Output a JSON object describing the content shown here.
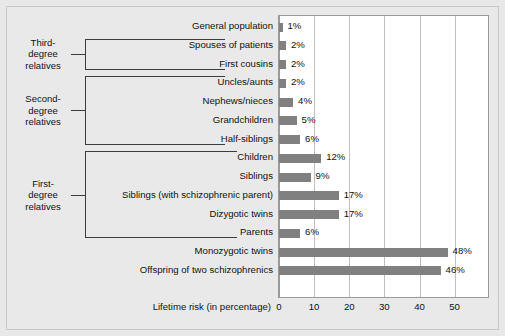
{
  "chart_data": {
    "type": "bar",
    "orientation": "horizontal",
    "title": "",
    "xlabel": "Lifetime risk (in percentage)",
    "ylabel": "",
    "xlim": [
      0,
      59.5
    ],
    "xticks": [
      0,
      10,
      20,
      30,
      40,
      50
    ],
    "xtick_labels": [
      "0",
      "10",
      "20",
      "30",
      "40",
      "50"
    ],
    "grid": "vertical",
    "legend": "none",
    "value_suffix": "%",
    "bar_color": "#808080",
    "plot_background": "#ffffff",
    "figure_background": "#e9e9e9",
    "categories": [
      "General population",
      "Spouses of patients",
      "First cousins",
      "Uncles/aunts",
      "Nephews/nieces",
      "Grandchildren",
      "Half-siblings",
      "Children",
      "Siblings",
      "Siblings (with schizophrenic parent)",
      "Dizygotic twins",
      "Parents",
      "Monozygotic twins",
      "Offspring of two schizophrenics"
    ],
    "values": [
      1,
      2,
      2,
      2,
      4,
      5,
      6,
      12,
      9,
      17,
      17,
      6,
      48,
      46
    ],
    "value_labels": [
      "1%",
      "2%",
      "2%",
      "2%",
      "4%",
      "5%",
      "6%",
      "12%",
      "9%",
      "17%",
      "17%",
      "6%",
      "48%",
      "46%"
    ],
    "groups": [
      {
        "label_lines": [
          "Third-",
          "degree",
          "relatives"
        ],
        "name": "third-degree-relatives",
        "first_index": 1,
        "last_index": 2
      },
      {
        "label_lines": [
          "Second-",
          "degree",
          "relatives"
        ],
        "name": "second-degree-relatives",
        "first_index": 3,
        "last_index": 6
      },
      {
        "label_lines": [
          "First-",
          "degree",
          "relatives"
        ],
        "name": "first-degree-relatives",
        "first_index": 7,
        "last_index": 11
      }
    ]
  }
}
